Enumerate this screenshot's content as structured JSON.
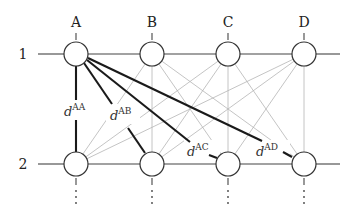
{
  "diagram": {
    "columns": [
      {
        "label": "A",
        "x": 76
      },
      {
        "label": "B",
        "x": 152
      },
      {
        "label": "C",
        "x": 228
      },
      {
        "label": "D",
        "x": 304
      }
    ],
    "rows": [
      {
        "label": "1",
        "y": 54
      },
      {
        "label": "2",
        "y": 164
      }
    ],
    "node_radius": 12,
    "continuation": "⋮",
    "highlighted_edges": [
      {
        "from": "A1",
        "to": "A2",
        "label_base": "d",
        "label_sup": "AA"
      },
      {
        "from": "A1",
        "to": "B2",
        "label_base": "d",
        "label_sup": "AB"
      },
      {
        "from": "A1",
        "to": "C2",
        "label_base": "d",
        "label_sup": "AC"
      },
      {
        "from": "A1",
        "to": "D2",
        "label_base": "d",
        "label_sup": "AD"
      }
    ],
    "colors": {
      "node_stroke": "#333333",
      "highlight_edge": "#1a1a1a",
      "faint_edge": "#b5b5b5",
      "row_line": "#444444"
    }
  }
}
